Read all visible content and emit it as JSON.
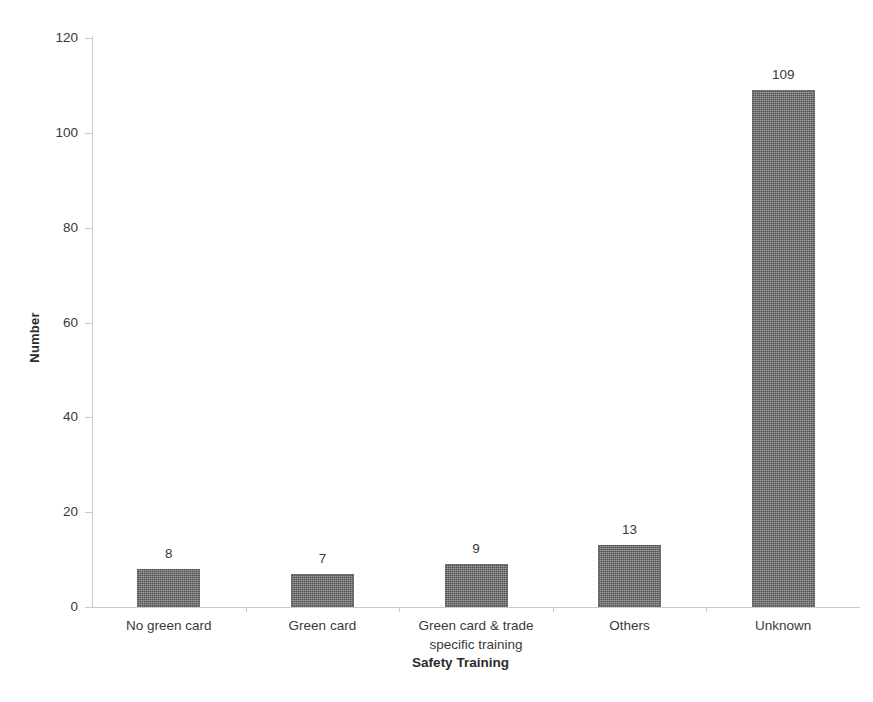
{
  "chart_data": {
    "type": "bar",
    "title": "",
    "xlabel": "Safety Training",
    "ylabel": "Number",
    "categories": [
      "No green card",
      "Green card",
      "Green card & trade specific training",
      "Others",
      "Unknown"
    ],
    "category_lines": [
      [
        "No green card"
      ],
      [
        "Green card"
      ],
      [
        "Green card & trade",
        "specific training"
      ],
      [
        "Others"
      ],
      [
        "Unknown"
      ]
    ],
    "values": [
      8,
      7,
      9,
      13,
      109
    ],
    "data_labels": [
      "8",
      "7",
      "9",
      "13",
      "109"
    ],
    "ylim": [
      0,
      120
    ],
    "ytick_values": [
      0,
      20,
      40,
      60,
      80,
      100,
      120
    ],
    "ytick_labels": [
      "0",
      "20",
      "40",
      "60",
      "80",
      "100",
      "120"
    ],
    "grid": false,
    "legend": false,
    "legend_position": "none",
    "bar_color": "#6e6e6e",
    "bar_fill_style": "dithered-gray-texture",
    "axis_color": "#c9c9c9",
    "background_color": "#ffffff",
    "text_color": "#3a3a3a"
  }
}
